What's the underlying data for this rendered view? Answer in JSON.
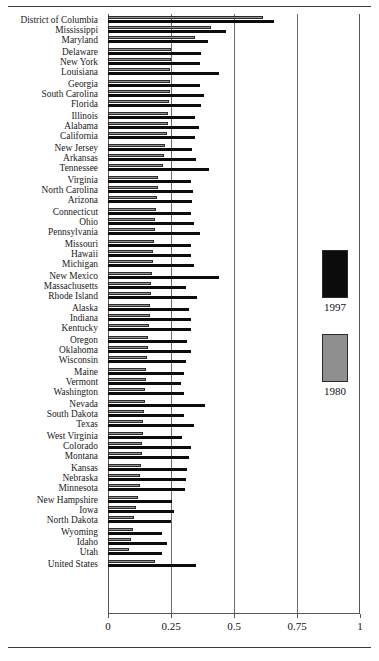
{
  "figure": {
    "background": "#ffffff",
    "colors": {
      "series_1997": "#0c0c0c",
      "series_1980": "#8f8f8f",
      "axis": "#555555",
      "grid": "#6b6b6b",
      "rule": "#3a3a3a"
    }
  },
  "legend": {
    "position": "right-middle",
    "items": [
      {
        "label": "1997",
        "swatch": "black-square-swatch"
      },
      {
        "label": "1980",
        "swatch": "gray-square-swatch"
      }
    ]
  },
  "axis": {
    "tick_labels": [
      "0",
      "0.25",
      "0.5",
      "0.75",
      "1"
    ],
    "tick_values": [
      0,
      0.25,
      0.5,
      0.75,
      1
    ]
  },
  "chart_data": {
    "type": "bar",
    "orientation": "horizontal",
    "title": "",
    "subtitle": "",
    "xlabel": "",
    "ylabel": "",
    "xlim": [
      0,
      1
    ],
    "ylim": null,
    "grid": true,
    "legend_position": "right",
    "xticks": [
      0,
      0.25,
      0.5,
      0.75,
      1
    ],
    "xticklabels": [
      "0",
      "0.25",
      "0.5",
      "0.75",
      "1"
    ],
    "categories": [
      "District of Columbia",
      "Mississippi",
      "Maryland",
      "Delaware",
      "New York",
      "Louisiana",
      "Georgia",
      "South Carolina",
      "Florida",
      "Illinois",
      "Alabama",
      "California",
      "New Jersey",
      "Arkansas",
      "Tennessee",
      "Virginia",
      "North Carolina",
      "Arizona",
      "Connecticut",
      "Ohio",
      "Pennsylvania",
      "Missouri",
      "Hawaii",
      "Michigan",
      "New Mexico",
      "Massachusetts",
      "Rhode Island",
      "Alaska",
      "Indiana",
      "Kentucky",
      "Oregon",
      "Oklahoma",
      "Wisconsin",
      "Maine",
      "Vermont",
      "Washington",
      "Nevada",
      "South Dakota",
      "Texas",
      "West Virginia",
      "Colorado",
      "Montana",
      "Kansas",
      "Nebraska",
      "Minnesota",
      "New Hampshire",
      "Iowa",
      "North Dakota",
      "Wyoming",
      "Idaho",
      "Utah",
      "United States"
    ],
    "group_breaks_after": [
      2,
      5,
      8,
      11,
      14,
      17,
      20,
      23,
      26,
      29,
      32,
      35,
      38,
      41,
      44,
      47,
      50
    ],
    "series": [
      {
        "name": "1980",
        "color": "#8f8f8f",
        "values": [
          0.615,
          0.41,
          0.345,
          0.25,
          0.25,
          0.248,
          0.247,
          0.245,
          0.243,
          0.24,
          0.238,
          0.235,
          0.225,
          0.222,
          0.22,
          0.2,
          0.198,
          0.195,
          0.19,
          0.188,
          0.185,
          0.183,
          0.18,
          0.178,
          0.175,
          0.172,
          0.17,
          0.167,
          0.165,
          0.163,
          0.16,
          0.158,
          0.155,
          0.152,
          0.15,
          0.148,
          0.145,
          0.143,
          0.14,
          0.138,
          0.135,
          0.133,
          0.13,
          0.128,
          0.125,
          0.118,
          0.112,
          0.105,
          0.098,
          0.09,
          0.082,
          0.185
        ]
      },
      {
        "name": "1997",
        "color": "#0c0c0c",
        "values": [
          0.66,
          0.47,
          0.395,
          0.37,
          0.365,
          0.44,
          0.365,
          0.38,
          0.37,
          0.345,
          0.36,
          0.345,
          0.335,
          0.348,
          0.4,
          0.33,
          0.338,
          0.335,
          0.33,
          0.34,
          0.365,
          0.33,
          0.33,
          0.34,
          0.44,
          0.31,
          0.355,
          0.32,
          0.33,
          0.33,
          0.315,
          0.33,
          0.31,
          0.3,
          0.29,
          0.3,
          0.385,
          0.3,
          0.34,
          0.295,
          0.33,
          0.32,
          0.315,
          0.31,
          0.305,
          0.255,
          0.26,
          0.25,
          0.215,
          0.235,
          0.215,
          0.35
        ]
      }
    ]
  }
}
